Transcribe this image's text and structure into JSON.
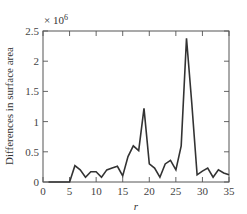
{
  "chart_data": {
    "type": "line",
    "title": "",
    "xlabel": "r",
    "ylabel": "Differences in surface area",
    "y_multiplier": "× 10",
    "y_multiplier_exp": "6",
    "xlim": [
      0,
      35
    ],
    "ylim": [
      0,
      2.5
    ],
    "x_ticks": [
      0,
      5,
      10,
      15,
      20,
      25,
      30,
      35
    ],
    "y_ticks": [
      0,
      0.5,
      1,
      1.5,
      2,
      2.5
    ],
    "y_tick_labels": [
      "0",
      "0.5",
      "1",
      "1.5",
      "2",
      "2.5"
    ],
    "grid": false,
    "legend": null,
    "series": [
      {
        "name": "Differences in surface area",
        "color": "#333333",
        "x": [
          1,
          2,
          3,
          4,
          5,
          6,
          7,
          8,
          9,
          10,
          11,
          12,
          13,
          14,
          15,
          16,
          17,
          18,
          19,
          20,
          21,
          22,
          23,
          24,
          25,
          26,
          27,
          28,
          29,
          30,
          31,
          32,
          33,
          34,
          35
        ],
        "values": [
          0,
          0,
          0,
          0,
          0,
          0.27,
          0.2,
          0.08,
          0.17,
          0.17,
          0.08,
          0.2,
          0.23,
          0.26,
          0.1,
          0.42,
          0.6,
          0.52,
          1.22,
          0.3,
          0.23,
          0.08,
          0.3,
          0.36,
          0.2,
          0.6,
          2.38,
          1.3,
          0.12,
          0.18,
          0.23,
          0.08,
          0.2,
          0.15,
          0.12
        ]
      }
    ]
  }
}
